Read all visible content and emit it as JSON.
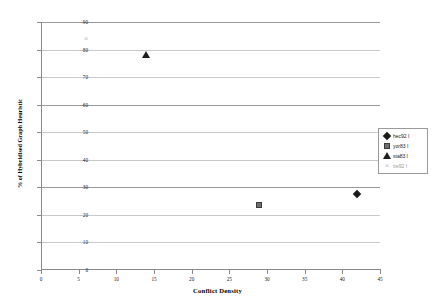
{
  "chart_data": {
    "type": "scatter",
    "title": "",
    "xlabel": "Conflict Density",
    "ylabel": "% of Hybridised Graph Heuristic",
    "xlim": [
      0,
      45
    ],
    "ylim": [
      0,
      90
    ],
    "xticks": [
      0,
      5,
      10,
      15,
      20,
      25,
      30,
      35,
      40,
      45
    ],
    "yticks": [
      0,
      10,
      20,
      30,
      40,
      50,
      60,
      70,
      80,
      90
    ],
    "grid": "horizontal",
    "legend_position": "right",
    "series": [
      {
        "name": "hec92 I",
        "marker": "diamond",
        "color": "#1a1a1a",
        "points": [
          {
            "x": 42,
            "y": 27.5
          }
        ]
      },
      {
        "name": "yor83 I",
        "marker": "square",
        "color": "#6e6e6e",
        "points": [
          {
            "x": 29,
            "y": 23.5
          }
        ]
      },
      {
        "name": "sta83 I",
        "marker": "triangle",
        "color": "#1f1f1f",
        "points": [
          {
            "x": 14,
            "y": 78
          }
        ]
      },
      {
        "name": "tre92 I",
        "marker": "cross",
        "color": "#c2c2c2",
        "points": [
          {
            "x": 6,
            "y": 84
          }
        ]
      }
    ]
  }
}
